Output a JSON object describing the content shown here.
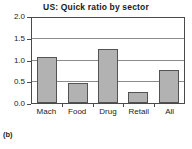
{
  "chart_data": {
    "type": "bar",
    "title": "US: Quick ratio by sector",
    "xlabel": "",
    "ylabel": "",
    "categories": [
      "Mach",
      "Food",
      "Drug",
      "Retail",
      "All"
    ],
    "values": [
      1.09,
      0.46,
      1.27,
      0.27,
      0.78
    ],
    "series": [
      {
        "name": "Quick ratio",
        "values": [
          1.09,
          0.46,
          1.27,
          0.27,
          0.78
        ]
      }
    ],
    "ylim": [
      0.0,
      2.0
    ],
    "yticks": [
      0.0,
      0.5,
      1.0,
      1.5,
      2.0
    ],
    "ytick_labels": [
      "0.0",
      "0.5",
      "1.0",
      "1.5",
      "2.0"
    ],
    "grid": true,
    "grid_axis": "y",
    "legend": false,
    "legend_position": "none",
    "bar_fill_color": "#b2b2b2",
    "bar_edge_color": "#535353",
    "gridline_color": "#8c8c8c",
    "axis_color": "#4a4a4a",
    "text_color": "#1a1a1a"
  },
  "figure": {
    "panel_caption": "(b)"
  }
}
